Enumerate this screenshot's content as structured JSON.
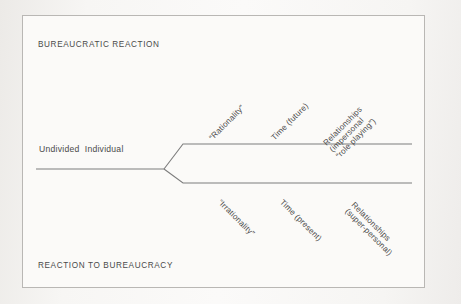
{
  "diagram": {
    "title_top": "BUREAUCRATIC REACTION",
    "title_bottom": "REACTION TO BUREAUCRACY",
    "root_label": "Undivided  Individual",
    "colors": {
      "background": "#f4f3f1",
      "panel": "#fbfaf8",
      "border": "#b9b7b4",
      "line": "#7d7d7d",
      "text": "#4a4a4a"
    },
    "upper_branch": {
      "labels": [
        {
          "lines": [
            "“Rationality”"
          ]
        },
        {
          "lines": [
            "Time (future)"
          ]
        },
        {
          "lines": [
            "Relationships",
            "(impersonal",
            "“role playing”)"
          ]
        }
      ]
    },
    "lower_branch": {
      "labels": [
        {
          "lines": [
            "“Irrationality”"
          ]
        },
        {
          "lines": [
            "Time (present)"
          ]
        },
        {
          "lines": [
            "Relationships",
            "(super-personal)"
          ]
        }
      ]
    }
  }
}
